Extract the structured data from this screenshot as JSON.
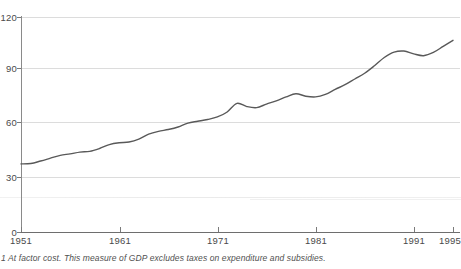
{
  "chart_data": {
    "type": "line",
    "title": "",
    "subtitle": "",
    "xlabel": "",
    "ylabel": "",
    "xlim": [
      1951,
      1995
    ],
    "ylim": [
      0,
      120
    ],
    "grid": true,
    "legend": null,
    "y_ticks": [
      0,
      30,
      60,
      90,
      120
    ],
    "y_tick_labels": [
      "0",
      "30",
      "60",
      "90",
      "120"
    ],
    "x_ticks": [
      1951,
      1961,
      1971,
      1981,
      1991,
      1995
    ],
    "x_tick_labels": [
      "1951",
      "1961",
      "1971",
      "1981",
      "1991",
      "1995"
    ],
    "series": [
      {
        "name": "GDP at factor cost (index)",
        "color": "#595959",
        "x": [
          1951,
          1952,
          1953,
          1954,
          1955,
          1956,
          1957,
          1958,
          1959,
          1960,
          1961,
          1962,
          1963,
          1964,
          1965,
          1966,
          1967,
          1968,
          1969,
          1970,
          1971,
          1972,
          1973,
          1974,
          1975,
          1976,
          1977,
          1978,
          1979,
          1980,
          1981,
          1982,
          1983,
          1984,
          1985,
          1986,
          1987,
          1988,
          1989,
          1990,
          1991,
          1992,
          1993,
          1994,
          1995
        ],
        "values": [
          38.0,
          38.2,
          39.6,
          41.2,
          42.8,
          43.6,
          44.6,
          45.0,
          46.6,
          48.8,
          49.8,
          50.2,
          51.8,
          54.6,
          56.2,
          57.2,
          58.6,
          60.8,
          61.8,
          62.8,
          64.2,
          67.0,
          71.8,
          70.0,
          69.4,
          71.4,
          73.2,
          75.4,
          77.2,
          75.8,
          75.4,
          76.8,
          79.6,
          82.2,
          85.4,
          88.6,
          92.8,
          97.4,
          100.4,
          101.0,
          99.4,
          98.4,
          100.2,
          103.6,
          107.0
        ]
      }
    ]
  },
  "axis": {
    "y_labels": [
      "120",
      "90",
      "60",
      "30",
      "0"
    ],
    "x_labels": [
      "1951",
      "1961",
      "1971",
      "1981",
      "1991",
      "1995"
    ]
  },
  "footnote": {
    "text": "1 At factor cost. This measure of GDP excludes taxes on expenditure and subsidies."
  },
  "colors": {
    "line": "#595959",
    "gridline": "#dcdcdc",
    "axis": "#7a7a7a",
    "text": "#4a4a4a",
    "background": "#ffffff"
  }
}
